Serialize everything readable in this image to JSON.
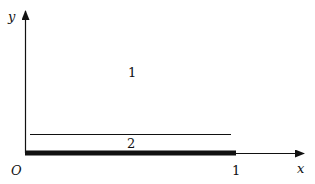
{
  "axes": {
    "x_label": "x",
    "y_label": "y",
    "origin_label": "O",
    "x_tick_label": "1"
  },
  "regions": {
    "region_1_label": "1",
    "region_2_label": "2"
  },
  "colors": {
    "stroke": "#111111",
    "background": "#ffffff"
  }
}
